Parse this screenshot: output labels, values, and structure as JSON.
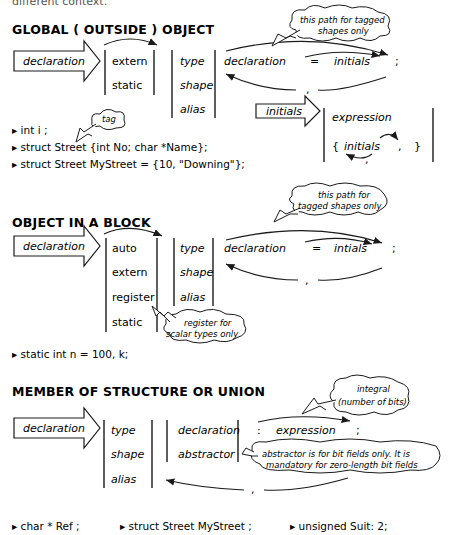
{
  "top_fragment": "different context.",
  "sections": {
    "global": {
      "title": "GLOBAL ( OUTSIDE ) OBJECT",
      "entry": "declaration",
      "storage": [
        "extern",
        "static"
      ],
      "types": [
        "type",
        "shape",
        "alias"
      ],
      "decl": "declaration",
      "eq": "=",
      "init": "initials",
      "semi": ";",
      "comma": ",",
      "note": [
        "this path for tagged",
        "shapes only"
      ],
      "initials_box": {
        "entry": "initials",
        "options": [
          "expression",
          "{",
          "initials",
          ",",
          "}"
        ],
        "loop_comma": ","
      },
      "tag_note": "tag",
      "examples": [
        "int i ;",
        "struct Street   {int No; char *Name};",
        "struct Street   MyStreet = {10, \"Downing\"};"
      ]
    },
    "block": {
      "title": "OBJECT IN A BLOCK",
      "entry": "declaration",
      "storage": [
        "auto",
        "extern",
        "register",
        "static"
      ],
      "types": [
        "type",
        "shape",
        "alias"
      ],
      "decl": "declaration",
      "eq": "=",
      "init": "intials",
      "semi": ";",
      "comma": ",",
      "note": [
        "this path for",
        "tagged shapes only"
      ],
      "register_note": [
        "register for",
        "scalar types only"
      ],
      "examples": [
        "static int n = 100,  k;"
      ]
    },
    "member": {
      "title": "MEMBER OF STRUCTURE OR UNION",
      "entry": "declaration",
      "types": [
        "type",
        "shape",
        "alias"
      ],
      "decls": [
        "declaration",
        "abstractor"
      ],
      "colon": ":",
      "expr": "expression",
      "semi": ";",
      "comma": ",",
      "bits_note": [
        "integral",
        "(number of bits)"
      ],
      "abstractor_note": [
        "abstractor is for bit fields only. It is",
        "mandatory for zero-length bit fields"
      ],
      "examples": [
        "char * Ref ;",
        "struct Street   MyStreet ;",
        "unsigned Suit: 2;"
      ]
    }
  }
}
